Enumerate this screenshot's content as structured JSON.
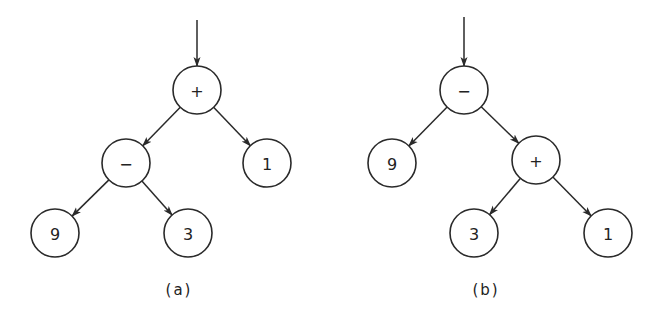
{
  "trees": [
    {
      "id": "a",
      "caption": "(a)",
      "expression": "(9 - 3) + 1",
      "root": "n0",
      "nodes": [
        {
          "id": "n0",
          "label": "+"
        },
        {
          "id": "n1",
          "label": "−"
        },
        {
          "id": "n2",
          "label": "1"
        },
        {
          "id": "n3",
          "label": "9"
        },
        {
          "id": "n4",
          "label": "3"
        }
      ],
      "edges": [
        {
          "from": "n0",
          "to": "n1"
        },
        {
          "from": "n0",
          "to": "n2"
        },
        {
          "from": "n1",
          "to": "n3"
        },
        {
          "from": "n1",
          "to": "n4"
        }
      ]
    },
    {
      "id": "b",
      "caption": "(b)",
      "expression": "9 - (3 + 1)",
      "root": "m0",
      "nodes": [
        {
          "id": "m0",
          "label": "−"
        },
        {
          "id": "m1",
          "label": "9"
        },
        {
          "id": "m2",
          "label": "+"
        },
        {
          "id": "m3",
          "label": "3"
        },
        {
          "id": "m4",
          "label": "1"
        }
      ],
      "edges": [
        {
          "from": "m0",
          "to": "m1"
        },
        {
          "from": "m0",
          "to": "m2"
        },
        {
          "from": "m2",
          "to": "m3"
        },
        {
          "from": "m2",
          "to": "m4"
        }
      ]
    }
  ]
}
